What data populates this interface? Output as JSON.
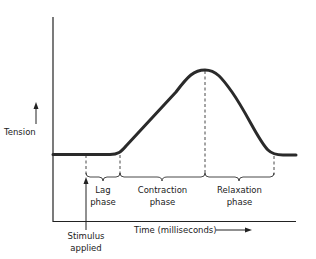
{
  "diagram": {
    "y_axis_label": "Tension",
    "x_axis_label": "Time (milliseconds)",
    "stimulus_label_line1": "Stimulus",
    "stimulus_label_line2": "applied",
    "phases": [
      {
        "line1": "Lag",
        "line2": "phase"
      },
      {
        "line1": "Contraction",
        "line2": "phase"
      },
      {
        "line1": "Relaxation",
        "line2": "phase"
      }
    ],
    "colors": {
      "curve": "#2a2a2a",
      "axis": "#222222",
      "text": "#222222"
    }
  }
}
